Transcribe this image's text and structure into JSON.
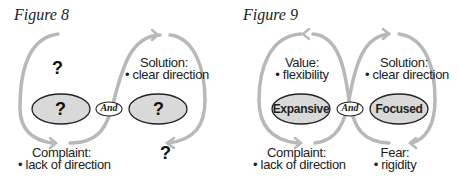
{
  "figures": [
    {
      "title": "Figure 8",
      "left_pole": "?",
      "right_pole": "?",
      "connector": "And",
      "top_left": {
        "heading": "?",
        "bullet": ""
      },
      "top_right": {
        "heading": "Solution:",
        "bullet": "• clear direction"
      },
      "bottom_left": {
        "heading": "Complaint:",
        "bullet": "• lack of direction"
      },
      "bottom_right": {
        "heading": "?",
        "bullet": ""
      }
    },
    {
      "title": "Figure 9",
      "left_pole": "Expansive",
      "right_pole": "Focused",
      "connector": "And",
      "top_left": {
        "heading": "Value:",
        "bullet": "• flexibility"
      },
      "top_right": {
        "heading": "Solution:",
        "bullet": "• clear direction"
      },
      "bottom_left": {
        "heading": "Complaint:",
        "bullet": "• lack of direction"
      },
      "bottom_right": {
        "heading": "Fear:",
        "bullet": "• rigidity"
      }
    }
  ],
  "colors": {
    "loop": "#b8b8b8",
    "ellipse_fill": "#d9d9d9",
    "ellipse_stroke": "#222222",
    "text": "#222222"
  }
}
